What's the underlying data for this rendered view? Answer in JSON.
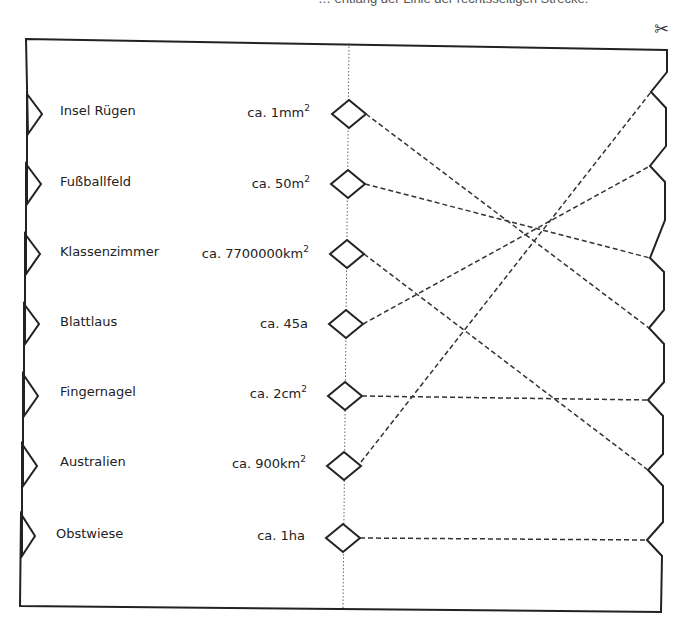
{
  "header": {
    "instruction_fragment": "… entlang der Linie der rechtsseitigen Strecke.",
    "scissors_icon": "✂"
  },
  "items": [
    {
      "name": "Insel Rügen",
      "value": "ca. 1mm",
      "unit_exp": "2",
      "connects_to_right_notch": 4
    },
    {
      "name": "Fußballfeld",
      "value": "ca. 50m",
      "unit_exp": "2",
      "connects_to_right_notch": 3
    },
    {
      "name": "Klassenzimmer",
      "value": "ca. 7700000km",
      "unit_exp": "2",
      "connects_to_right_notch": 6
    },
    {
      "name": "Blattlaus",
      "value": "ca. 45a",
      "unit_exp": "",
      "connects_to_right_notch": 2
    },
    {
      "name": "Fingernagel",
      "value": "ca. 2cm",
      "unit_exp": "2",
      "connects_to_right_notch": 5
    },
    {
      "name": "Australien",
      "value": "ca. 900km",
      "unit_exp": "2",
      "connects_to_right_notch": 1
    },
    {
      "name": "Obstwiese",
      "value": "ca. 1ha",
      "unit_exp": "",
      "connects_to_right_notch": 7
    }
  ],
  "colors": {
    "frame": "#222222",
    "dashed_line": "#333333",
    "dotted_line": "#666666"
  }
}
